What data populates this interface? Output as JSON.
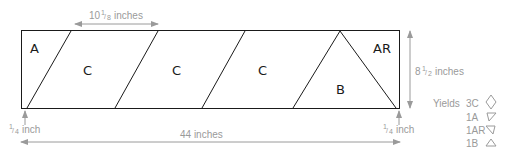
{
  "diagram": {
    "pieces": [
      {
        "label": "A"
      },
      {
        "label": "C"
      },
      {
        "label": "C"
      },
      {
        "label": "C"
      },
      {
        "label": "B"
      },
      {
        "label": "AR"
      }
    ],
    "dimensions": {
      "piece_width": {
        "whole": "10",
        "num": "1",
        "den": "8",
        "unit": "inches"
      },
      "strip_height": {
        "whole": "8",
        "num": "1",
        "den": "2",
        "unit": "inches"
      },
      "strip_length": {
        "text": "44 inches"
      },
      "margin_left": {
        "num": "1",
        "den": "4",
        "unit": "inch"
      },
      "margin_right": {
        "num": "1",
        "den": "4",
        "unit": "inch"
      }
    },
    "yields": {
      "title": "Yields",
      "items": [
        {
          "qty": "3C",
          "shape": "diamond-icon"
        },
        {
          "qty": "1A",
          "shape": "triangle-down-left-icon"
        },
        {
          "qty": "1AR",
          "shape": "triangle-down-right-icon"
        },
        {
          "qty": "1B",
          "shape": "triangle-up-icon"
        }
      ]
    },
    "colors": {
      "outline": "#1a1a1a",
      "annotation": "#9a9a9a"
    }
  }
}
